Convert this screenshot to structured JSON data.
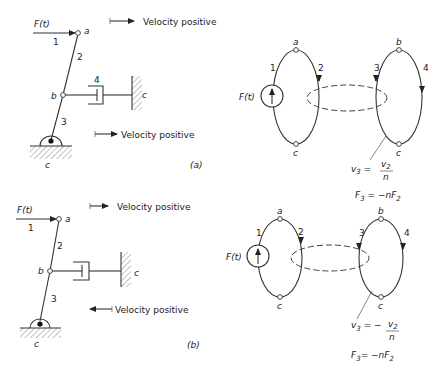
{
  "figure": {
    "panel_a": {
      "caption": "(a)",
      "mechanism": {
        "force_label": "F(t)",
        "force_arrow_number": "1",
        "node_a": "a",
        "node_b": "b",
        "link_2": "2",
        "link_3": "3",
        "damper_number": "4",
        "wall_label": "c",
        "ground_label": "c",
        "velocity_top": "Velocity positive",
        "velocity_bottom": "Velocity positive"
      },
      "graph": {
        "source_label": "F(t)",
        "edge_1": "1",
        "edge_2": "2",
        "edge_3": "3",
        "edge_4": "4",
        "node_a": "a",
        "node_b": "b",
        "node_c_left": "c",
        "node_c_right": "c",
        "eq_velocity_lhs": "v",
        "eq_velocity_lhs_sub": "3",
        "eq_velocity_eq": " = ",
        "eq_velocity_num": "v",
        "eq_velocity_num_sub": "2",
        "eq_velocity_den": "n",
        "eq_force": "F",
        "eq_force_sub": "3",
        "eq_force_rhs": " = −nF",
        "eq_force_rhs_sub": "2"
      }
    },
    "panel_b": {
      "caption": "(b)",
      "mechanism": {
        "force_label": "F(t)",
        "force_arrow_number": "1",
        "node_a": "a",
        "node_b": "b",
        "link_2": "2",
        "link_3": "3",
        "wall_label": "c",
        "ground_label": "c",
        "velocity_top": "Velocity positive",
        "velocity_bottom": "Velocity positive"
      },
      "graph": {
        "source_label": "F(t)",
        "edge_1": "1",
        "edge_2": "2",
        "edge_3": "3",
        "edge_4": "4",
        "node_a": "a",
        "node_b": "b",
        "node_c_left": "c",
        "node_c_right": "c",
        "eq_velocity_lhs": "v",
        "eq_velocity_lhs_sub": "3",
        "eq_velocity_eq": " = −",
        "eq_velocity_num": "v",
        "eq_velocity_num_sub": "2",
        "eq_velocity_den": "n",
        "eq_force": "F",
        "eq_force_sub": "3",
        "eq_force_rhs": "= −nF",
        "eq_force_rhs_sub": "2"
      }
    }
  }
}
